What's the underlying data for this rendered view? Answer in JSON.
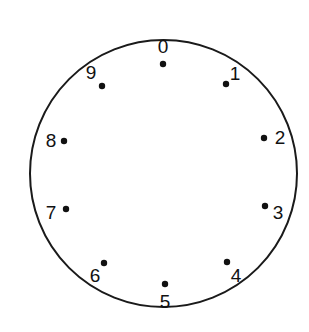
{
  "diagram": {
    "type": "dial-face",
    "colors": {
      "stroke": "#1a1a1a",
      "dot": "#111111",
      "text": "#111111",
      "background": "#ffffff"
    },
    "circle": {
      "cx": 163.5,
      "cy": 173.5,
      "r": 133.5,
      "stroke_width": 2
    },
    "positions": [
      {
        "label": "0",
        "dot": [
          163,
          64
        ],
        "text": [
          163,
          53
        ]
      },
      {
        "label": "1",
        "dot": [
          226,
          84
        ],
        "text": [
          235,
          80
        ]
      },
      {
        "label": "2",
        "dot": [
          264,
          138
        ],
        "text": [
          280,
          144
        ]
      },
      {
        "label": "3",
        "dot": [
          265,
          206
        ],
        "text": [
          278,
          219
        ]
      },
      {
        "label": "4",
        "dot": [
          227,
          262
        ],
        "text": [
          236,
          282
        ]
      },
      {
        "label": "5",
        "dot": [
          165,
          284
        ],
        "text": [
          165,
          308
        ]
      },
      {
        "label": "6",
        "dot": [
          104,
          263
        ],
        "text": [
          95,
          282
        ]
      },
      {
        "label": "7",
        "dot": [
          66,
          209
        ],
        "text": [
          51,
          219
        ]
      },
      {
        "label": "8",
        "dot": [
          64,
          141
        ],
        "text": [
          51,
          147
        ]
      },
      {
        "label": "9",
        "dot": [
          102,
          86
        ],
        "text": [
          91,
          79
        ]
      }
    ]
  }
}
